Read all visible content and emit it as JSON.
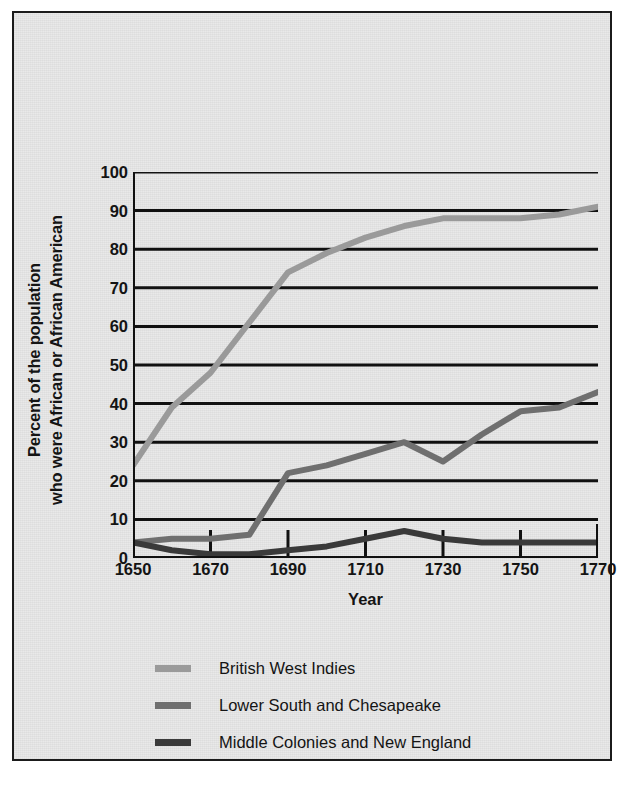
{
  "chart_data": {
    "type": "line",
    "title": "",
    "xlabel": "Year",
    "ylabel": "Percent of the population who were African or African American",
    "ylabel_line1": "Percent of the population",
    "ylabel_line2": "who were African or African American",
    "x": [
      1650,
      1660,
      1670,
      1680,
      1690,
      1700,
      1710,
      1720,
      1730,
      1740,
      1750,
      1760,
      1770
    ],
    "xlim": [
      1650,
      1770
    ],
    "ylim": [
      0,
      100
    ],
    "xticks": [
      1650,
      1670,
      1690,
      1710,
      1730,
      1750,
      1770
    ],
    "xtick_labels": [
      "1650",
      "1670",
      "1690",
      "1710",
      "1730",
      "1750",
      "1770"
    ],
    "yticks": [
      0,
      10,
      20,
      30,
      40,
      50,
      60,
      70,
      80,
      90,
      100
    ],
    "ytick_labels": [
      "0",
      "10",
      "20",
      "30",
      "40",
      "50",
      "60",
      "70",
      "80",
      "90",
      "100"
    ],
    "grid": true,
    "grid_axis": "y",
    "legend_position": "below",
    "series": [
      {
        "name": "British West Indies",
        "color": "#9a9a9a",
        "values": [
          24,
          39,
          48,
          61,
          74,
          79,
          83,
          86,
          88,
          88,
          88,
          89,
          91
        ]
      },
      {
        "name": "Lower South and Chesapeake",
        "color": "#6f6f6f",
        "values": [
          4,
          5,
          5,
          6,
          22,
          24,
          27,
          30,
          25,
          32,
          38,
          39,
          43
        ]
      },
      {
        "name": "Middle Colonies and New England",
        "color": "#3a3a3a",
        "values": [
          4,
          2,
          1,
          1,
          2,
          3,
          5,
          7,
          5,
          4,
          4,
          4,
          4
        ]
      }
    ]
  },
  "legend": {
    "items": [
      {
        "label": "British West Indies",
        "color": "#9a9a9a"
      },
      {
        "label": "Lower South and Chesapeake",
        "color": "#6f6f6f"
      },
      {
        "label": "Middle Colonies and New England",
        "color": "#3a3a3a"
      }
    ]
  },
  "colors": {
    "page_background": "#e9e9e9",
    "frame": "#1b1b1b",
    "axis": "#111111",
    "gridline": "#111111",
    "text": "#141414"
  }
}
